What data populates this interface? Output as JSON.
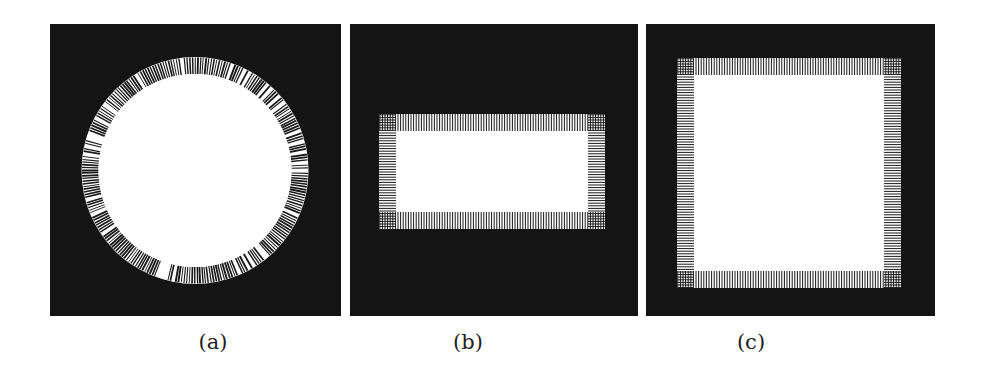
{
  "figure": {
    "background": "#ffffff",
    "panel_color": "#141414",
    "fill_color": "#ffffff",
    "hatch_color": "#1a1a1a",
    "panels": [
      {
        "id": "a",
        "label": "(a)",
        "shape": "circle",
        "description": "White disk with a hatched ring boundary on a black background",
        "box": {
          "x": 50,
          "y": 24,
          "w": 291,
          "h": 292
        },
        "caption_pos": {
          "x": 213,
          "y": 330
        },
        "geometry": {
          "cx": 195,
          "cy": 170.5,
          "r_outer": 113.5,
          "r_inner": 96.5
        }
      },
      {
        "id": "b",
        "label": "(b)",
        "shape": "rectangle",
        "description": "White rectangle with a hatched border band on a black background",
        "box": {
          "x": 350,
          "y": 24,
          "w": 288,
          "h": 292
        },
        "caption_pos": {
          "x": 468,
          "y": 330
        },
        "geometry": {
          "x": 379,
          "y": 114,
          "w": 226,
          "h": 115,
          "band": 17
        }
      },
      {
        "id": "c",
        "label": "(c)",
        "shape": "square",
        "description": "White square with a hatched border band on a black background",
        "box": {
          "x": 646,
          "y": 24,
          "w": 289,
          "h": 292
        },
        "caption_pos": {
          "x": 751,
          "y": 330
        },
        "geometry": {
          "x": 677,
          "y": 58,
          "w": 224,
          "h": 230,
          "band": 17
        }
      }
    ]
  }
}
